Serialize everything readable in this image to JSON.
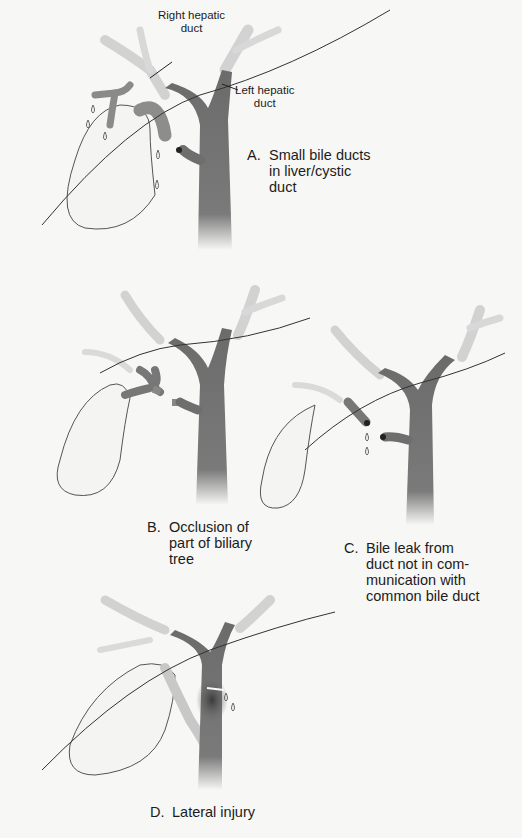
{
  "figure": {
    "colors": {
      "background": "#f7f7f5",
      "duct_dark": "#6e6e6e",
      "duct_light": "#cfcfcf",
      "outline": "#3a3a3a"
    },
    "panels": [
      {
        "id": "A",
        "letter": "A.",
        "caption": "Small bile ducts\nin liver/cystic\nduct",
        "annotations": [
          {
            "id": "right-hepatic",
            "text": "Right hepatic\nduct"
          },
          {
            "id": "left-hepatic",
            "text": "Left hepatic\nduct"
          }
        ]
      },
      {
        "id": "B",
        "letter": "B.",
        "caption": "Occlusion of\npart of biliary\ntree"
      },
      {
        "id": "C",
        "letter": "C.",
        "caption": "Bile leak from\nduct not in com-\nmunication with\ncommon bile duct"
      },
      {
        "id": "D",
        "letter": "D.",
        "caption": "Lateral injury"
      }
    ]
  }
}
